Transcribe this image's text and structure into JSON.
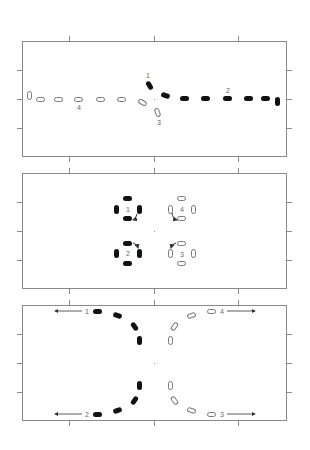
{
  "figure": {
    "panels": [
      {
        "id": "panel-1",
        "description": "Merging / splitting trajectory: filled series 1 and 2 along right, hollow series 3 and 4 along left",
        "frame": {
          "x": 22,
          "y": 41,
          "w": 265,
          "h": 116
        },
        "labels": [
          {
            "text": "1",
            "x": 147,
            "y": 72
          },
          {
            "text": "2",
            "x": 226,
            "y": 59
          },
          {
            "text": "3",
            "x": 158,
            "y": 119
          },
          {
            "text": "4",
            "x": 77,
            "y": 102
          }
        ],
        "center_mark": {
          "x": 154,
          "y": 99
        }
      },
      {
        "id": "panel-2",
        "description": "Four rotating clusters: filled 1 and 2 on left, hollow 3 and 4 on right, each with curved arrow",
        "frame": {
          "x": 22,
          "y": 173,
          "w": 265,
          "h": 116
        },
        "labels": [
          {
            "text": "1",
            "x": 126,
            "y": 205
          },
          {
            "text": "2",
            "x": 126,
            "y": 250
          },
          {
            "text": "3",
            "x": 180,
            "y": 251
          },
          {
            "text": "4",
            "x": 180,
            "y": 206
          }
        ],
        "center_mark": {
          "x": 154,
          "y": 231
        }
      },
      {
        "id": "panel-3",
        "description": "Diverging trajectories: filled 1 and 2 curve left, hollow 3 and 4 curve right, with outward arrows",
        "frame": {
          "x": 22,
          "y": 305,
          "w": 265,
          "h": 116
        },
        "labels": [
          {
            "text": "1",
            "x": 85,
            "y": 308
          },
          {
            "text": "2",
            "x": 85,
            "y": 410
          },
          {
            "text": "3",
            "x": 220,
            "y": 410
          },
          {
            "text": "4",
            "x": 220,
            "y": 308
          }
        ],
        "center_mark": {
          "x": 154,
          "y": 363
        }
      }
    ],
    "colors": {
      "frame": "#8a8a8a",
      "filled": "#111111",
      "hollow_border": "#777777",
      "label": "#666666"
    }
  }
}
